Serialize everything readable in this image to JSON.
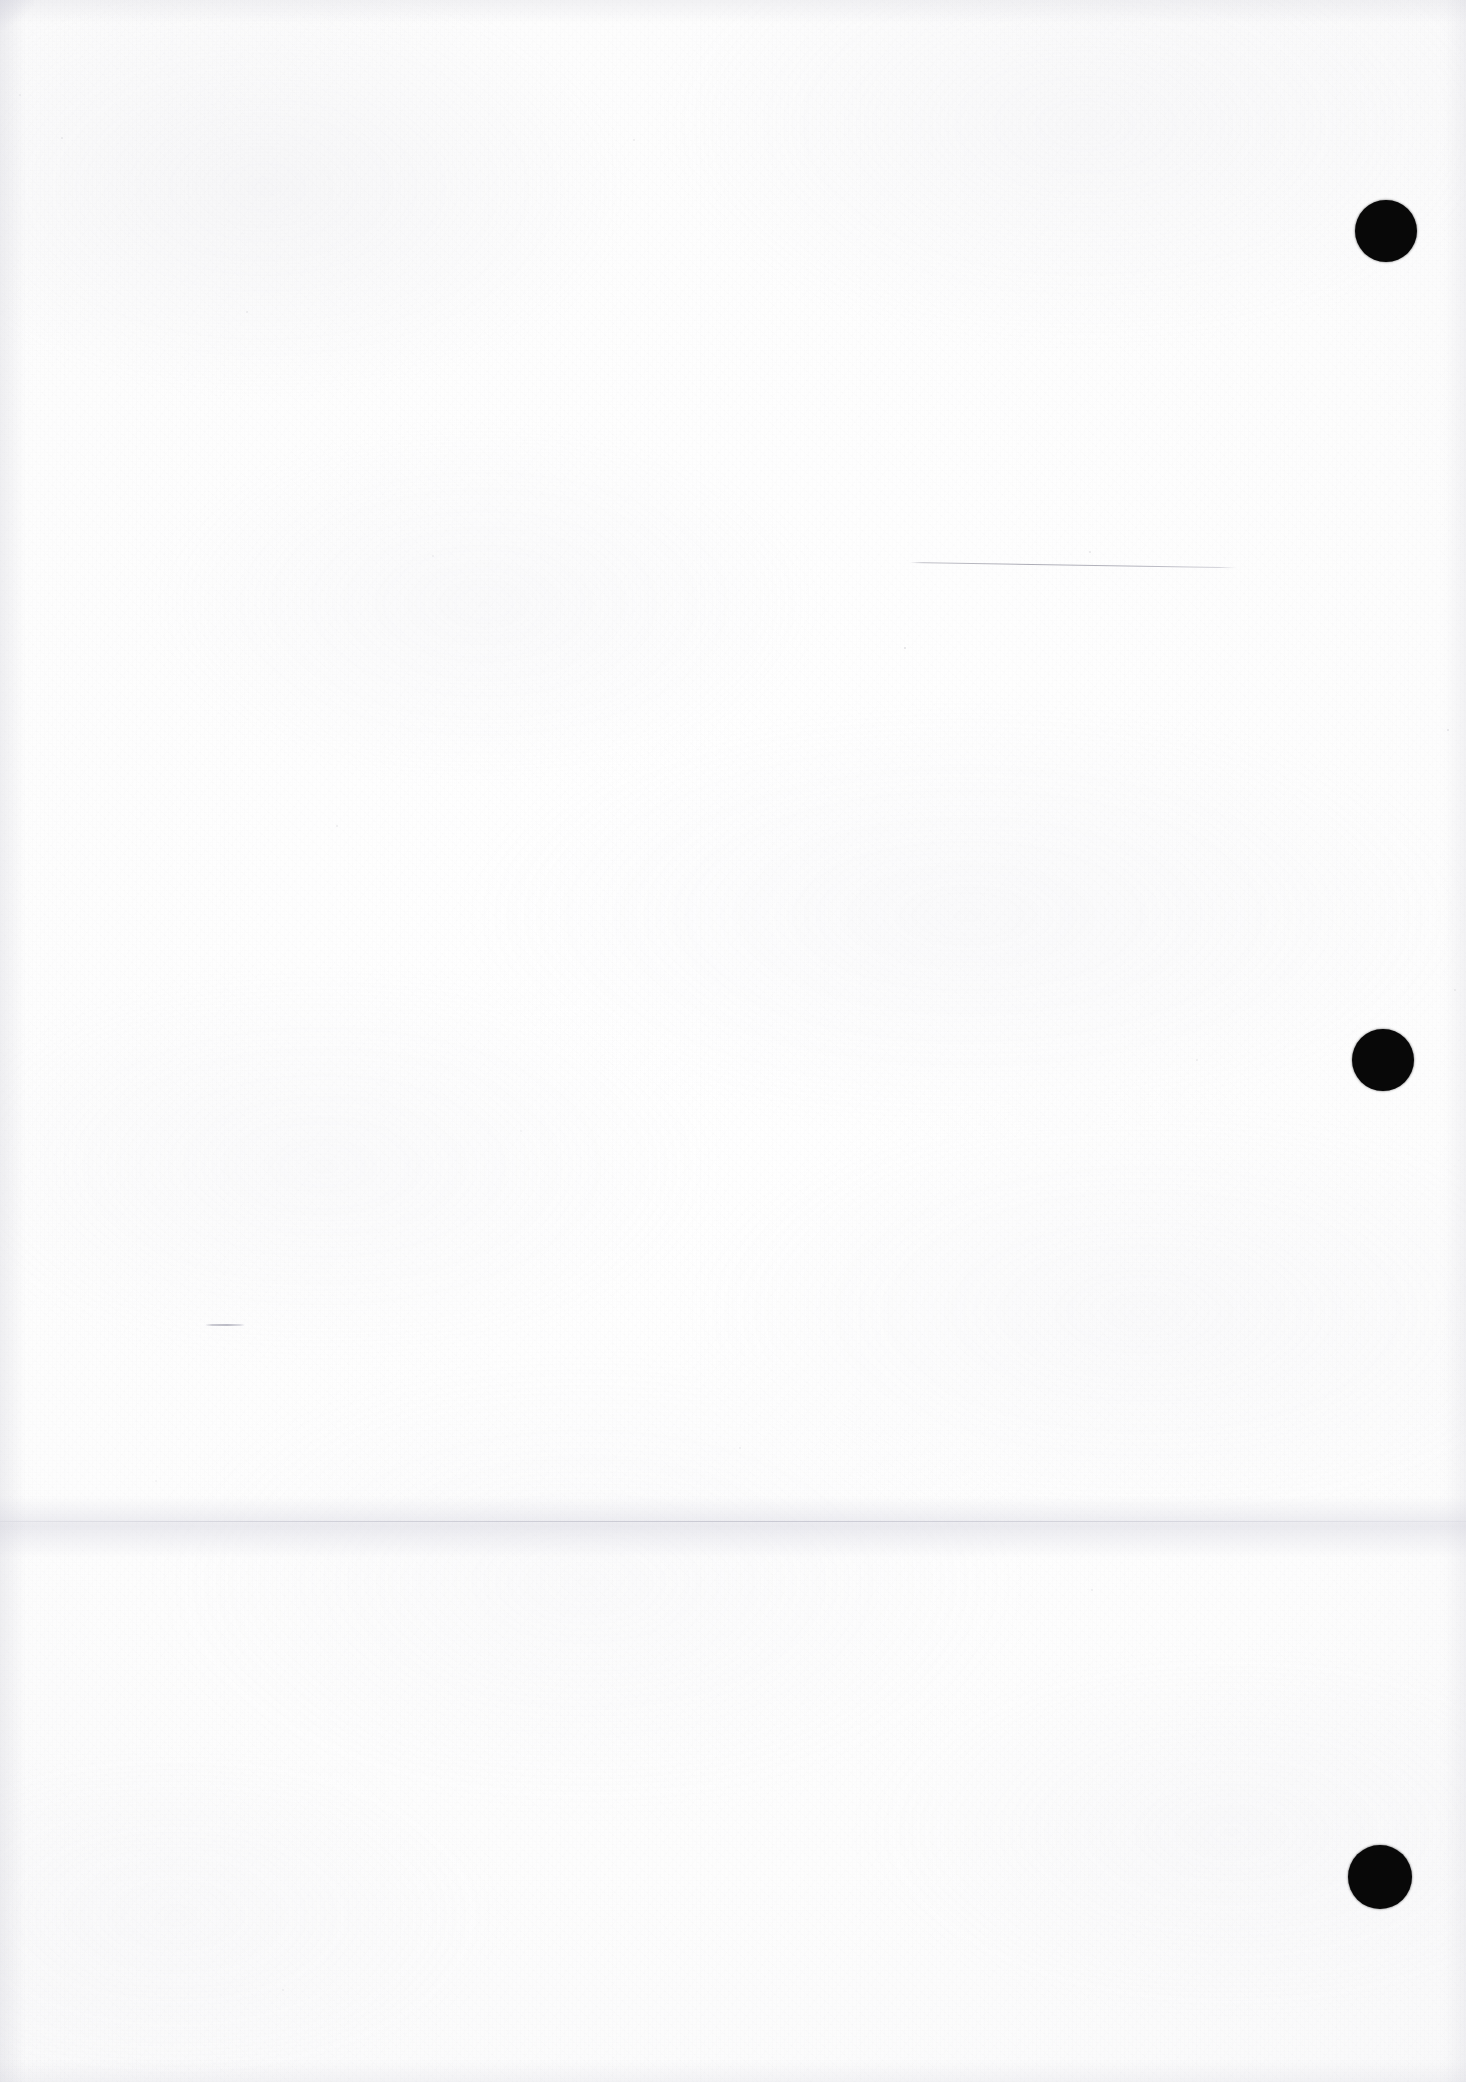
{
  "document": {
    "kind": "scanned-page",
    "title": "Blank scanned document page",
    "page_width": 1466,
    "page_height": 2082,
    "background_color": "#fcfcfc",
    "ink_color": "#080808",
    "visible_text": "",
    "text_content_note": "No legible text is present on this page."
  },
  "marks": {
    "punch_holes": [
      {
        "name": "punch-hole-top",
        "x": 1355,
        "y": 200,
        "diameter": 62,
        "color": "#080808"
      },
      {
        "name": "punch-hole-middle",
        "x": 1352,
        "y": 1029,
        "diameter": 62,
        "color": "#080808"
      },
      {
        "name": "punch-hole-bottom",
        "x": 1348,
        "y": 1845,
        "diameter": 64,
        "color": "#080808"
      }
    ],
    "rules": [
      {
        "name": "faint-horizontal-rule",
        "x": 910,
        "y": 562,
        "length": 327,
        "rotation_deg": 0.9,
        "color": "#9a9aa4"
      }
    ],
    "dashes": [
      {
        "name": "faint-left-dash",
        "x": 205,
        "y": 1324,
        "length": 40,
        "color": "#b4b4bf"
      }
    ],
    "creases": [
      {
        "name": "horizontal-fold-band",
        "y": 1496,
        "height": 62,
        "line_y": 1521,
        "color": "#d6d6e0"
      }
    ]
  },
  "texture": {
    "grain": "fine-paper-grain",
    "streaks": "vertical-scan-streaks",
    "vignette": "soft-edge-shading",
    "speck_count": 16
  }
}
